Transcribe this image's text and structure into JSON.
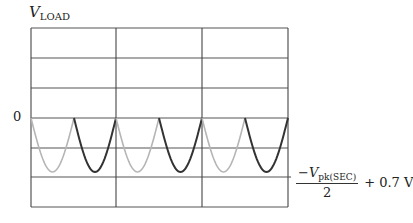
{
  "axis": {
    "y_label_main": "V",
    "y_label_sub": "LOAD",
    "zero_label": "0"
  },
  "annotation": {
    "numerator_sign": "−",
    "numerator_var": "V",
    "numerator_sub": "pk(SEC)",
    "denominator": "2",
    "suffix": "+ 0.7 V"
  },
  "grid": {
    "left": 31,
    "right": 288,
    "top": 28,
    "bottom": 207,
    "vertical_lines": [
      116,
      202
    ],
    "horizontal_lines": [
      28,
      58,
      88,
      118,
      148,
      177,
      207
    ],
    "zero_y": 118
  },
  "waveform": {
    "trough_y": 172,
    "colors": {
      "light": "#b5b5b5",
      "dark": "#333333"
    },
    "cycles": [
      {
        "x0": 31,
        "x1": 74,
        "shade": "light"
      },
      {
        "x0": 74,
        "x1": 116,
        "shade": "dark"
      },
      {
        "x0": 116,
        "x1": 159,
        "shade": "light"
      },
      {
        "x0": 159,
        "x1": 202,
        "shade": "dark"
      },
      {
        "x0": 202,
        "x1": 245,
        "shade": "light"
      },
      {
        "x0": 245,
        "x1": 288,
        "shade": "dark"
      }
    ]
  }
}
